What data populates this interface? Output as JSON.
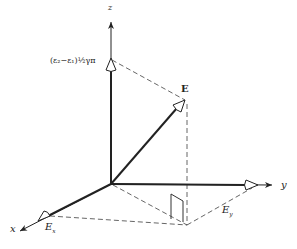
{
  "diagram": {
    "type": "3d-vector-decomposition",
    "axes": {
      "x": {
        "label": "x"
      },
      "y": {
        "label": "y"
      },
      "z": {
        "label": "z"
      }
    },
    "vector": {
      "label": "E"
    },
    "components": {
      "x": {
        "label": "E",
        "sub": "x"
      },
      "y": {
        "label": "E",
        "sub": "y"
      },
      "z": {
        "label": "(ε₂−ε₁)½γπ"
      }
    },
    "colors": {
      "line": "#222222",
      "dash": "#555555",
      "background": "#ffffff"
    }
  }
}
